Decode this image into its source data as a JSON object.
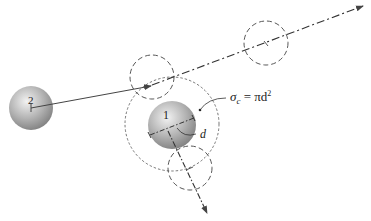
{
  "diagram": {
    "molecule_2": {
      "label": "2",
      "cx": 31,
      "cy": 108,
      "r": 22
    },
    "molecule_1": {
      "label": "1",
      "cx": 172,
      "cy": 125,
      "r": 24
    },
    "collision_sphere": {
      "cx": 172,
      "cy": 124,
      "r": 47
    },
    "diameter_label": "d",
    "cross_section_formula": {
      "sigma": "σ",
      "subscript": "c",
      "equals": " = πd",
      "superscript": "2"
    },
    "ghost_positions": [
      {
        "name": "impact-position",
        "cx": 152,
        "cy": 77,
        "r": 22
      },
      {
        "name": "upper-right-trajectory-position",
        "cx": 266,
        "cy": 43,
        "r": 22
      },
      {
        "name": "lower-trajectory-position",
        "cx": 190,
        "cy": 168,
        "r": 22
      }
    ],
    "colors": {
      "sphere_light": "#e8e8e8",
      "sphere_dark": "#8a8a8a",
      "line": "#333333",
      "dashed": "#555555"
    }
  }
}
